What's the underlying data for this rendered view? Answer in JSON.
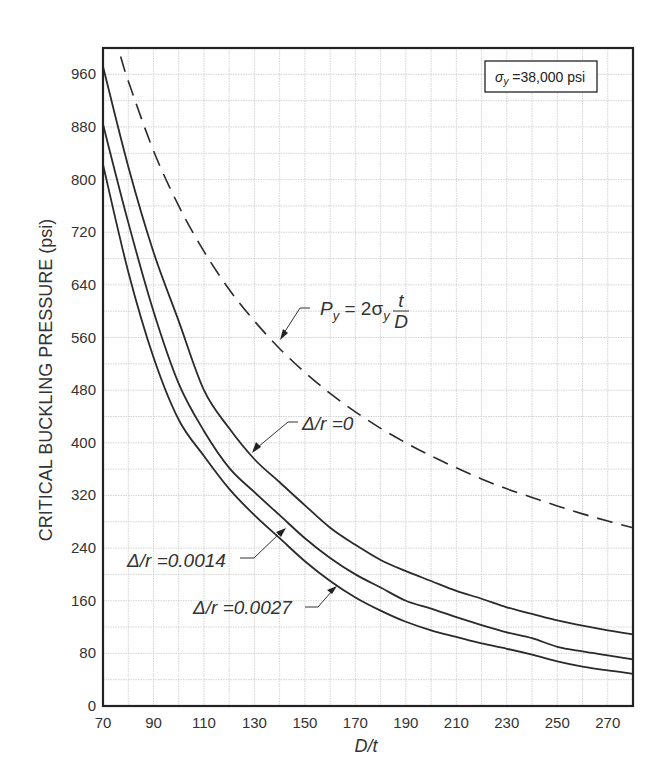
{
  "chart_data": {
    "type": "line",
    "title": "",
    "xlabel": "D/t",
    "ylabel": "CRITICAL BUCKLING PRESSURE (psi)",
    "xlim": [
      70,
      280
    ],
    "ylim": [
      0,
      1000
    ],
    "x_ticks": [
      70,
      90,
      110,
      130,
      150,
      170,
      190,
      210,
      230,
      250,
      270
    ],
    "y_ticks": [
      0,
      80,
      160,
      240,
      320,
      400,
      480,
      560,
      640,
      720,
      800,
      880,
      960
    ],
    "grid": true,
    "grid_minor_x_step": 10,
    "grid_minor_y_step": 40,
    "legend_box": "σy =38,000 psi",
    "x": [
      70,
      80,
      90,
      100,
      110,
      120,
      130,
      140,
      150,
      160,
      170,
      180,
      190,
      200,
      210,
      220,
      230,
      240,
      250,
      260,
      270,
      280
    ],
    "series": [
      {
        "name": "Δ/r =0",
        "style": "solid",
        "values": [
          972,
          820,
          690,
          585,
          480,
          422,
          375,
          340,
          305,
          271,
          245,
          222,
          205,
          190,
          175,
          163,
          150,
          140,
          130,
          122,
          115,
          109
        ]
      },
      {
        "name": "Δ/r =0.0014",
        "style": "solid",
        "values": [
          884,
          735,
          600,
          490,
          418,
          362,
          325,
          290,
          255,
          225,
          200,
          180,
          160,
          148,
          135,
          123,
          112,
          103,
          90,
          83,
          77,
          71
        ]
      },
      {
        "name": "Δ/r =0.0027",
        "style": "solid",
        "values": [
          823,
          660,
          530,
          435,
          380,
          330,
          290,
          255,
          220,
          190,
          165,
          145,
          128,
          115,
          105,
          95,
          87,
          78,
          68,
          60,
          54,
          49
        ]
      },
      {
        "name": "Py = 2σy t/D",
        "style": "dashed",
        "x": [
          77,
          80,
          90,
          100,
          110,
          120,
          130,
          140,
          150,
          160,
          170,
          180,
          190,
          200,
          210,
          220,
          230,
          240,
          250,
          260,
          270,
          280
        ],
        "values": [
          987,
          950,
          844,
          760,
          691,
          633,
          585,
          543,
          507,
          475,
          447,
          422,
          400,
          380,
          362,
          345,
          330,
          317,
          304,
          292,
          281,
          271
        ]
      }
    ],
    "annotations": [
      {
        "text": "Py = 2σy t/D",
        "series": 3,
        "label_x": 148,
        "label_y": 575,
        "arrow_to_x": 138,
        "arrow_to_y": 560
      },
      {
        "text": "Δ/r =0",
        "series": 0,
        "label_x": 147,
        "label_y": 430,
        "arrow_to_x": 128,
        "arrow_to_y": 385
      },
      {
        "text": "Δ/r =0.0014",
        "series": 1,
        "label_x": 80,
        "label_y": 218,
        "arrow_to_x": 142,
        "arrow_to_y": 268
      },
      {
        "text": "Δ/r =0.0027",
        "series": 2,
        "label_x": 106,
        "label_y": 148,
        "arrow_to_x": 165,
        "arrow_to_y": 177
      }
    ]
  },
  "labels": {
    "ylabel": "CRITICAL BUCKLING PRESSURE (psi)",
    "xlabel": "D/t",
    "legend_sigma": "σ",
    "legend_sub": "y",
    "legend_rest": " =38,000 psi",
    "py_P": "P",
    "py_sub": "y",
    "py_eq": " = 2σ",
    "py_sub2": "y",
    "py_num": "t",
    "py_den": "D",
    "dr0": "Δ/r =0",
    "dr1": "Δ/r =0.0014",
    "dr2": "Δ/r =0.0027"
  }
}
